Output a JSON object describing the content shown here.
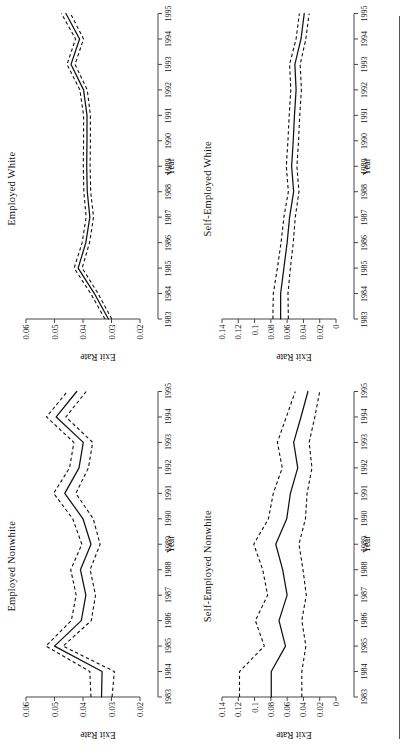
{
  "figure": {
    "layout": "2x2",
    "orientation": "rotated-90-ccw",
    "rule": "horizontal-rule"
  },
  "chart_data": [
    {
      "type": "line",
      "title": "Employed Nonwhite",
      "xlabel": "Year",
      "ylabel": "Exit Rate",
      "x": [
        1983,
        1984,
        1985,
        1986,
        1987,
        1988,
        1989,
        1990,
        1991,
        1992,
        1993,
        1994,
        1995
      ],
      "xlim": [
        1983,
        1995
      ],
      "ylim": [
        0.02,
        0.06
      ],
      "yticks": [
        0.02,
        0.03,
        0.04,
        0.05,
        0.06
      ],
      "ytick_labels": [
        "0.02",
        "0.03",
        "0.04",
        "0.05",
        "0.06"
      ],
      "xtick_labels": [
        "1983",
        "1984",
        "1985",
        "1986",
        "1987",
        "1988",
        "1989",
        "1990",
        "1991",
        "1992",
        "1993",
        "1994",
        "1995"
      ],
      "grid": false,
      "legend": "none",
      "series": [
        {
          "name": "Exit rate (point estimate)",
          "style": "solid",
          "values": [
            0.0335,
            0.0333,
            0.05,
            0.0406,
            0.039,
            0.0409,
            0.0372,
            0.04,
            0.0464,
            0.0414,
            0.0399,
            0.0494,
            0.0422
          ]
        },
        {
          "name": "Upper confidence bound",
          "style": "dashed",
          "values": [
            0.0372,
            0.0376,
            0.053,
            0.0441,
            0.0424,
            0.0443,
            0.0404,
            0.0436,
            0.0503,
            0.0447,
            0.0432,
            0.0528,
            0.0455
          ]
        },
        {
          "name": "Lower confidence bound",
          "style": "dashed",
          "values": [
            0.0298,
            0.029,
            0.047,
            0.0371,
            0.0356,
            0.0375,
            0.034,
            0.0364,
            0.0425,
            0.0381,
            0.0366,
            0.046,
            0.0389
          ]
        }
      ]
    },
    {
      "type": "line",
      "title": "Employed White",
      "xlabel": "Year",
      "ylabel": "Exit Rate",
      "x": [
        1983,
        1984,
        1985,
        1986,
        1987,
        1988,
        1989,
        1990,
        1991,
        1992,
        1993,
        1994,
        1995
      ],
      "xlim": [
        1983,
        1995
      ],
      "ylim": [
        0.02,
        0.06
      ],
      "yticks": [
        0.02,
        0.03,
        0.04,
        0.05,
        0.06
      ],
      "ytick_labels": [
        "0.02",
        "0.03",
        "0.04",
        "0.05",
        "0.06"
      ],
      "xtick_labels": [
        "1983",
        "1984",
        "1985",
        "1986",
        "1987",
        "1988",
        "1989",
        "1990",
        "1991",
        "1992",
        "1993",
        "1994",
        "1995"
      ],
      "grid": false,
      "legend": "none",
      "series": [
        {
          "name": "Exit rate (point estimate)",
          "style": "solid",
          "values": [
            0.0311,
            0.036,
            0.0417,
            0.039,
            0.0376,
            0.0385,
            0.0387,
            0.0386,
            0.0386,
            0.0398,
            0.0442,
            0.0412,
            0.046
          ]
        },
        {
          "name": "Upper confidence bound",
          "style": "dashed",
          "values": [
            0.0323,
            0.0373,
            0.0431,
            0.0403,
            0.0389,
            0.0397,
            0.0399,
            0.0398,
            0.0398,
            0.0411,
            0.0456,
            0.0426,
            0.0476
          ]
        },
        {
          "name": "Lower confidence bound",
          "style": "dashed",
          "values": [
            0.0299,
            0.0347,
            0.0403,
            0.0377,
            0.0363,
            0.0373,
            0.0375,
            0.0374,
            0.0374,
            0.0385,
            0.0428,
            0.0398,
            0.0444
          ]
        }
      ]
    },
    {
      "type": "line",
      "title": "Self-Employed Nonwhite",
      "xlabel": "Year",
      "ylabel": "Exit Rate",
      "x": [
        1983,
        1984,
        1985,
        1986,
        1987,
        1988,
        1989,
        1990,
        1991,
        1992,
        1993,
        1994,
        1995
      ],
      "xlim": [
        1983,
        1995
      ],
      "ylim": [
        0,
        0.14
      ],
      "yticks": [
        0,
        0.02,
        0.04,
        0.06,
        0.08,
        0.1,
        0.12,
        0.14
      ],
      "ytick_labels": [
        "0",
        "0.02",
        "0.04",
        "0.06",
        "0.08",
        "0.1",
        "0.12",
        "0.14"
      ],
      "xtick_labels": [
        "1983",
        "1984",
        "1985",
        "1986",
        "1987",
        "1988",
        "1989",
        "1990",
        "1991",
        "1992",
        "1993",
        "1994",
        "1995"
      ],
      "grid": false,
      "legend": "none",
      "series": [
        {
          "name": "Exit rate (point estimate)",
          "style": "solid",
          "values": [
            0.0795,
            0.0795,
            0.062,
            0.07,
            0.06,
            0.0655,
            0.074,
            0.0605,
            0.056,
            0.047,
            0.052,
            0.043,
            0.0345
          ]
        },
        {
          "name": "Upper confidence bound",
          "style": "dashed",
          "values": [
            0.1185,
            0.1185,
            0.088,
            0.099,
            0.084,
            0.09,
            0.101,
            0.083,
            0.077,
            0.066,
            0.072,
            0.061,
            0.05
          ]
        },
        {
          "name": "Lower confidence bound",
          "style": "dashed",
          "values": [
            0.042,
            0.042,
            0.037,
            0.042,
            0.0365,
            0.0405,
            0.0455,
            0.0375,
            0.0355,
            0.0295,
            0.033,
            0.026,
            0.02
          ]
        }
      ]
    },
    {
      "type": "line",
      "title": "Self-Employed White",
      "xlabel": "Year",
      "ylabel": "Exit Rate",
      "x": [
        1983,
        1984,
        1985,
        1986,
        1987,
        1988,
        1989,
        1990,
        1991,
        1992,
        1993,
        1994,
        1995
      ],
      "xlim": [
        1983,
        1995
      ],
      "ylim": [
        0,
        0.14
      ],
      "yticks": [
        0,
        0.02,
        0.04,
        0.06,
        0.08,
        0.1,
        0.12,
        0.14
      ],
      "ytick_labels": [
        "0",
        "0.02",
        "0.04",
        "0.06",
        "0.08",
        "0.1",
        "0.12",
        "0.14"
      ],
      "xtick_labels": [
        "1983",
        "1984",
        "1985",
        "1986",
        "1987",
        "1988",
        "1989",
        "1990",
        "1991",
        "1992",
        "1993",
        "1994",
        "1995"
      ],
      "grid": false,
      "legend": "none",
      "series": [
        {
          "name": "Exit rate (point estimate)",
          "style": "solid",
          "values": [
            0.068,
            0.068,
            0.064,
            0.06,
            0.057,
            0.052,
            0.0545,
            0.0525,
            0.051,
            0.049,
            0.0505,
            0.043,
            0.039
          ]
        },
        {
          "name": "Upper confidence bound",
          "style": "dashed",
          "values": [
            0.0775,
            0.077,
            0.072,
            0.0675,
            0.064,
            0.0585,
            0.061,
            0.059,
            0.0575,
            0.0555,
            0.057,
            0.049,
            0.045
          ]
        },
        {
          "name": "Lower confidence bound",
          "style": "dashed",
          "values": [
            0.0585,
            0.059,
            0.056,
            0.0525,
            0.05,
            0.0455,
            0.048,
            0.046,
            0.0445,
            0.0425,
            0.044,
            0.037,
            0.033
          ]
        }
      ]
    }
  ]
}
